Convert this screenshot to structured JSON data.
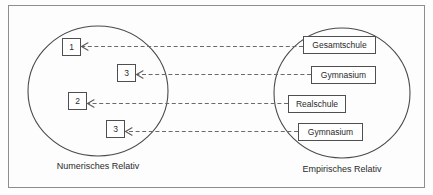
{
  "figure": {
    "frame": {
      "x": 8,
      "y": 5,
      "width": 417,
      "height": 183
    },
    "left_set": {
      "caption": "Numerisches Relativ",
      "caption_x": 98,
      "caption_y": 167,
      "circle": {
        "cx": 98,
        "cy": 91,
        "rx": 70,
        "ry": 65
      },
      "nodes": [
        {
          "label": "1",
          "x": 62,
          "y": 38,
          "width": 18,
          "height": 17
        },
        {
          "label": "3",
          "x": 117,
          "y": 64,
          "width": 18,
          "height": 17
        },
        {
          "label": "2",
          "x": 68,
          "y": 92,
          "width": 18,
          "height": 17
        },
        {
          "label": "3",
          "x": 106,
          "y": 120,
          "width": 18,
          "height": 17
        }
      ]
    },
    "right_set": {
      "caption": "Empirisches Relativ",
      "caption_x": 342,
      "caption_y": 170,
      "circle": {
        "cx": 342,
        "cy": 93,
        "rx": 68,
        "ry": 65
      },
      "nodes": [
        {
          "label": "Gesamtschule",
          "x": 303,
          "y": 36,
          "width": 72,
          "height": 17
        },
        {
          "label": "Gymnasium",
          "x": 311,
          "y": 66,
          "width": 64,
          "height": 17
        },
        {
          "label": "Realschule",
          "x": 288,
          "y": 95,
          "width": 57,
          "height": 17
        },
        {
          "label": "Gymnasium",
          "x": 298,
          "y": 123,
          "width": 64,
          "height": 17
        }
      ]
    },
    "arrows": [
      {
        "name": "arrow-gesamtschule-to-1",
        "from_x": 303,
        "to_x": 82,
        "y": 46.5
      },
      {
        "name": "arrow-gymnasium-to-3",
        "from_x": 311,
        "to_x": 137,
        "y": 74.5
      },
      {
        "name": "arrow-realschule-to-2",
        "from_x": 288,
        "to_x": 88,
        "y": 103.5
      },
      {
        "name": "arrow-gymnasium-to-3-lower",
        "from_x": 298,
        "to_x": 126,
        "y": 131.5
      }
    ],
    "colors": {
      "frame_stroke": "#8d8d8d",
      "circle_stroke": "#4a4a4a",
      "box_stroke": "#4f4f4f",
      "arrow_stroke": "#6a6a6a",
      "text": "#2a2a2a",
      "background": "#fdfdfd"
    }
  }
}
